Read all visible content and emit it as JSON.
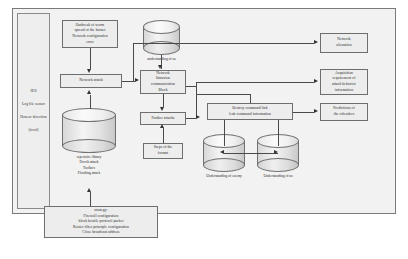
{
  "diagram": {
    "type": "flowchart",
    "sidebar": {
      "name": "monitoring-column",
      "lines": [
        "IDS",
        "Log file\nsensor",
        "Honeor\ndetection",
        "(local)"
      ]
    },
    "nodes": {
      "outbreak": {
        "label": "Outbreak of worm\nspread of the botnet\nNetwork configuration\nerror"
      },
      "network_attack": {
        "label": "Network attack"
      },
      "understanding_us_top": {
        "label": "understanding of us"
      },
      "intrusion_block": {
        "label": "Network\nIntrusion\ncommunication\nBlock"
      },
      "further_attacks": {
        "label": "Further attacks"
      },
      "steps_format": {
        "label": "Steps of the\nformat"
      },
      "destroy_command": {
        "label": "Destroy command link\nleak command information"
      },
      "network_alienation": {
        "label": "Network\nalienation"
      },
      "acquisition_requirement": {
        "label": "Acquisition\nrequirement of\nattack behavior\ninformation"
      },
      "predictions": {
        "label": "Predictions of\nthe offenders"
      },
      "repertoire_library": {
        "label": "repertoire library\nDvoch attack\nToolbox\nFlooding attack"
      },
      "understanding_enemy": {
        "label": "Understanding of enemy"
      },
      "understanding_us_bottom": {
        "label": "Understanding of us"
      },
      "strategy": {
        "label": "strategy:\nFirewall configuration\nblock hostile protocol packet\nRouter filter principle configuration\nClose broadcast address"
      }
    },
    "colors": {
      "frame_background": "#f2f2f2",
      "frame_border": "#7a7a7a",
      "box_fill": "#ededed",
      "box_border": "#6e6e6e",
      "connector": "#4a4a4a",
      "arrow": "#333333",
      "text": "#1f1f1f",
      "page_background": "#ffffff"
    }
  }
}
